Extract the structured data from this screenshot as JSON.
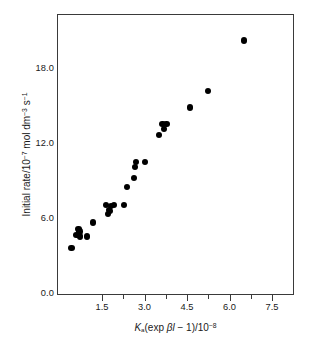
{
  "chart_data": {
    "type": "scatter",
    "title": "",
    "xlabel": "Ka(exp βl − 1)/10⁻⁸",
    "ylabel": "Initial rate/10⁻⁷ mol dm⁻³ s⁻¹",
    "xlim": [
      0.9,
      8.2
    ],
    "ylim": [
      -1.2,
      21.0
    ],
    "grid": false,
    "legend": null,
    "marker": "filled-circle",
    "marker_color": "#000000",
    "xticks": [
      1.5,
      3.0,
      4.5,
      6.0,
      7.5
    ],
    "xtick_labels": [
      "1.5",
      "3.0",
      "4.5",
      "6.0",
      "7.5"
    ],
    "xticks_minor": [
      2.25,
      3.75,
      5.25,
      6.75
    ],
    "yticks": [
      0.0,
      6.0,
      12.0,
      18.0
    ],
    "ytick_labels": [
      "0.0",
      "6.0",
      "12.0",
      "18.0"
    ],
    "yticks_minor": [
      3.0,
      9.0,
      15.0
    ],
    "points": [
      {
        "x": 1.32,
        "y": 2.6
      },
      {
        "x": 1.47,
        "y": 3.6
      },
      {
        "x": 1.53,
        "y": 4.1
      },
      {
        "x": 1.56,
        "y": 3.9
      },
      {
        "x": 1.58,
        "y": 3.5
      },
      {
        "x": 1.79,
        "y": 3.5
      },
      {
        "x": 1.97,
        "y": 4.6
      },
      {
        "x": 2.37,
        "y": 6.0
      },
      {
        "x": 2.44,
        "y": 5.3
      },
      {
        "x": 2.47,
        "y": 5.6
      },
      {
        "x": 2.5,
        "y": 5.5
      },
      {
        "x": 2.54,
        "y": 5.9
      },
      {
        "x": 2.62,
        "y": 6.0
      },
      {
        "x": 2.93,
        "y": 6.0
      },
      {
        "x": 3.03,
        "y": 7.4
      },
      {
        "x": 3.24,
        "y": 8.1
      },
      {
        "x": 3.28,
        "y": 9.0
      },
      {
        "x": 3.31,
        "y": 9.4
      },
      {
        "x": 3.58,
        "y": 9.4
      },
      {
        "x": 4.02,
        "y": 11.5
      },
      {
        "x": 4.12,
        "y": 12.4
      },
      {
        "x": 4.17,
        "y": 12.0
      },
      {
        "x": 4.24,
        "y": 12.4
      },
      {
        "x": 4.96,
        "y": 13.7
      },
      {
        "x": 5.52,
        "y": 15.0
      },
      {
        "x": 6.62,
        "y": 19.0
      }
    ],
    "axis_titles": {
      "y_parts": {
        "lead": "Initial rate/10",
        "exp1": "−7",
        "mid": " mol dm",
        "exp2": "−3",
        "unit_s": " s",
        "exp3": "−1"
      },
      "x_parts": {
        "k_symbol": "K",
        "k_subscript": "a",
        "expr": "(exp ",
        "beta": "βl",
        "minus_one": " − 1)/10",
        "exp": "−8"
      }
    }
  }
}
